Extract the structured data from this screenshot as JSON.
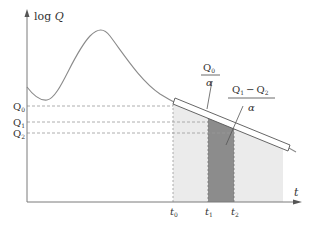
{
  "diagram": {
    "y_axis_label": {
      "prefix": "log ",
      "var": "Q"
    },
    "x_axis_label": "t",
    "y_ticks": [
      {
        "main": "Q",
        "sub": "0",
        "y": 106
      },
      {
        "main": "Q",
        "sub": "1",
        "y": 122
      },
      {
        "main": "Q",
        "sub": "2",
        "y": 133
      }
    ],
    "x_ticks": [
      {
        "main": "t",
        "sub": "0",
        "x": 173
      },
      {
        "main": "t",
        "sub": "1",
        "x": 208
      },
      {
        "main": "t",
        "sub": "2",
        "x": 234
      }
    ],
    "annotation_1": {
      "numerator_main": "Q",
      "numerator_sub": "0",
      "denominator": "α"
    },
    "annotation_2": {
      "num_a_main": "Q",
      "num_a_sub": "1",
      "minus": "−",
      "num_b_main": "Q",
      "num_b_sub": "2",
      "denominator": "α"
    },
    "colors": {
      "axis": "#7a7a7a",
      "curve": "#8a8a8a",
      "light_fill": "#ebebeb",
      "dark_fill": "#8c8c8c",
      "dashed": "#999999",
      "text": "#333333"
    }
  }
}
